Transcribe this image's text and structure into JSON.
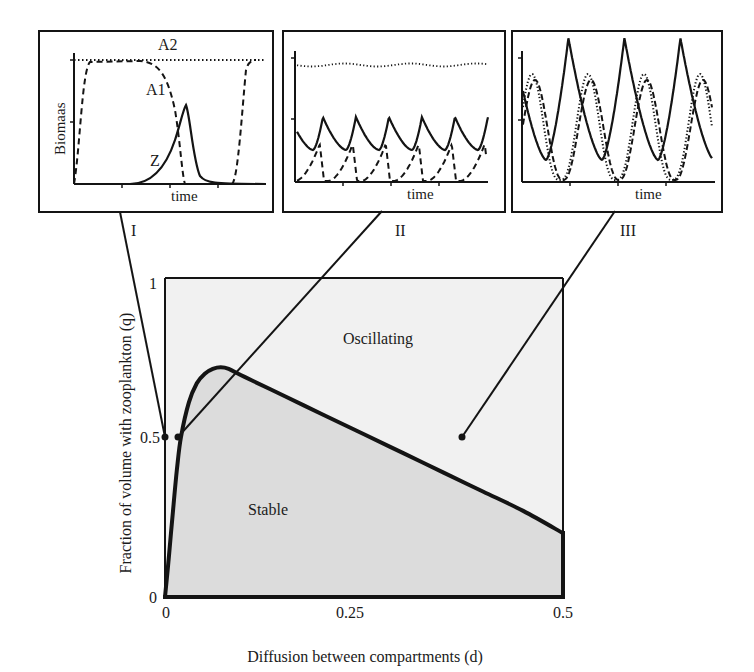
{
  "chart_data": [
    {
      "id": "main",
      "type": "area",
      "title": "",
      "xlabel": "Diffusion between  compartments (d)",
      "ylabel": "Fraction of volume with zooplankton (q)",
      "xlim": [
        0,
        0.5
      ],
      "ylim": [
        0,
        1
      ],
      "x_ticks": [
        "0",
        "0.25",
        "0.5"
      ],
      "y_ticks": [
        "0",
        "0.5",
        "1"
      ],
      "grid": false,
      "legend": null,
      "regions": [
        {
          "name": "Oscillating",
          "label": "Oscillating",
          "fill": "#f1f1f1",
          "label_pos": [
            0.27,
            0.81
          ]
        },
        {
          "name": "Stable",
          "label": "Stable",
          "fill": "#dcdcdc",
          "label_pos": [
            0.13,
            0.27
          ]
        }
      ],
      "boundary_curve": {
        "name": "stability boundary",
        "x": [
          0.0,
          0.005,
          0.01,
          0.015,
          0.02,
          0.03,
          0.04,
          0.05,
          0.06,
          0.07,
          0.08,
          0.1,
          0.15,
          0.2,
          0.25,
          0.3,
          0.35,
          0.4,
          0.45,
          0.5
        ],
        "y": [
          0.0,
          0.13,
          0.27,
          0.4,
          0.5,
          0.61,
          0.67,
          0.7,
          0.715,
          0.72,
          0.715,
          0.69,
          0.63,
          0.57,
          0.51,
          0.45,
          0.39,
          0.33,
          0.27,
          0.2
        ]
      },
      "marked_points": [
        {
          "label": "I",
          "d": 0.0,
          "q": 0.5
        },
        {
          "label": "II",
          "d": 0.016,
          "q": 0.5
        },
        {
          "label": "III",
          "d": 0.37,
          "q": 0.5
        }
      ]
    },
    {
      "id": "inset_I",
      "type": "line",
      "panel_label": "I",
      "xlabel": "time",
      "ylabel": "Biomaas",
      "series": [
        {
          "name": "A2",
          "style": "dotted",
          "description": "constant at maximum"
        },
        {
          "name": "A1",
          "style": "dashed",
          "description": "rises to max, collapses as Z peaks, recovers"
        },
        {
          "name": "Z",
          "style": "solid",
          "description": "single sharp peak ~0.65 of max"
        }
      ],
      "series_labels": [
        "A2",
        "A1",
        "Z"
      ]
    },
    {
      "id": "inset_II",
      "type": "line",
      "panel_label": "II",
      "xlabel": "time",
      "series": [
        {
          "name": "A2",
          "style": "dotted",
          "description": "nearly constant near top with small ripple"
        },
        {
          "name": "Z",
          "style": "solid",
          "description": "small regular oscillation, 6 peaks"
        },
        {
          "name": "A1",
          "style": "dashed",
          "description": "regular oscillation between 0 and ~0.35"
        }
      ]
    },
    {
      "id": "inset_III",
      "type": "line",
      "panel_label": "III",
      "xlabel": "time",
      "series": [
        {
          "name": "Z",
          "style": "solid",
          "description": "large oscillation, 3 tall peaks"
        },
        {
          "name": "A1",
          "style": "dashed",
          "description": "large oscillation, out of phase"
        },
        {
          "name": "A2",
          "style": "dotted",
          "description": "large oscillation, similar to A1"
        }
      ]
    }
  ],
  "labels": {
    "inset_I_ylabel": "Biomaas",
    "inset_I_A2": "A2",
    "inset_I_A1": "A1",
    "inset_I_Z": "Z",
    "inset_xlabel": "time",
    "roman_I": "I",
    "roman_II": "II",
    "roman_III": "III",
    "main_xlabel": "Diffusion between  compartments (d)",
    "main_ylabel": "Fraction of volume with zooplankton (q)",
    "region_oscillating": "Oscillating",
    "region_stable": "Stable",
    "ytick_0": "0",
    "ytick_05": "0.5",
    "ytick_1": "1",
    "xtick_0": "0",
    "xtick_025": "0.25",
    "xtick_05": "0.5"
  },
  "colors": {
    "line": "#141414",
    "oscillating_fill": "#f1f1f1",
    "stable_fill": "#dcdcdc",
    "inset_bg": "#ffffff"
  }
}
